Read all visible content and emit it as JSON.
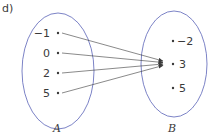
{
  "part_label": "d)",
  "sets": [
    {
      "name": "A",
      "elements": [
        "−1",
        "0",
        "2",
        "5"
      ]
    },
    {
      "name": "B",
      "elements": [
        "−2",
        "3",
        "5"
      ]
    }
  ],
  "mapping": [
    {
      "from": "−1",
      "to": "3"
    },
    {
      "from": "0",
      "to": "3"
    },
    {
      "from": "2",
      "to": "3"
    },
    {
      "from": "5",
      "to": "3"
    }
  ],
  "colors": {
    "ellipse": "#5b63b8",
    "arrow": "#3a3a3a",
    "text": "#3a3a3a"
  }
}
